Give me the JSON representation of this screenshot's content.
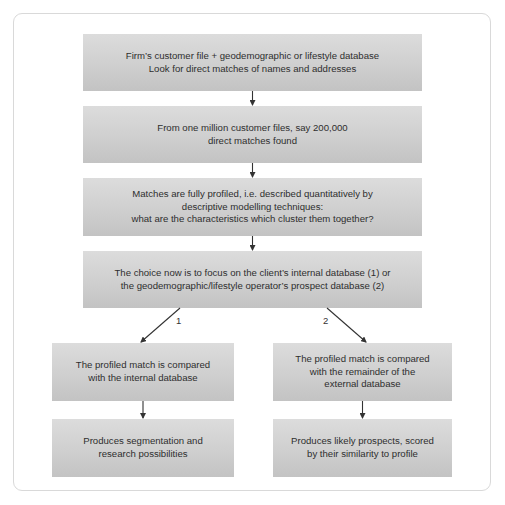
{
  "diagram": {
    "nodes": [
      {
        "id": "n1",
        "text": "Firm’s customer file + geodemographic or lifestyle database\nLook for direct matches of names and addresses"
      },
      {
        "id": "n2",
        "text": "From one million customer files, say 200,000\ndirect matches found"
      },
      {
        "id": "n3",
        "text": "Matches are fully profiled, i.e. described quantitatively by\ndescriptive modelling techniques:\nwhat are the characteristics which cluster them together?"
      },
      {
        "id": "n4",
        "text": "The choice now is to focus on the client’s internal database (1) or\nthe geodemographic/lifestyle operator’s prospect database (2)"
      },
      {
        "id": "n5",
        "text": "The profiled match is compared\nwith the internal database"
      },
      {
        "id": "n6",
        "text": "The profiled match is compared\nwith the remainder of the\nexternal database"
      },
      {
        "id": "n7",
        "text": "Produces segmentation and\nresearch possibilities"
      },
      {
        "id": "n8",
        "text": "Produces likely prospects, scored\nby their similarity to profile"
      }
    ],
    "edges": [
      {
        "from": "n1",
        "to": "n2",
        "label": ""
      },
      {
        "from": "n2",
        "to": "n3",
        "label": ""
      },
      {
        "from": "n3",
        "to": "n4",
        "label": ""
      },
      {
        "from": "n4",
        "to": "n5",
        "label": "1"
      },
      {
        "from": "n4",
        "to": "n6",
        "label": "2"
      },
      {
        "from": "n5",
        "to": "n7",
        "label": ""
      },
      {
        "from": "n6",
        "to": "n8",
        "label": ""
      }
    ],
    "colors": {
      "box_top": "#dcdcdc",
      "box_bottom": "#c3c3c3",
      "text": "#2e2e2e",
      "arrow": "#333333",
      "panel_border": "#d9d9d9"
    }
  }
}
